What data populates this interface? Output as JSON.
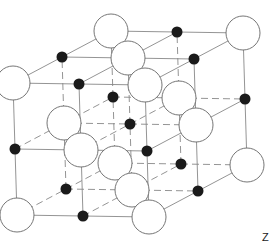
{
  "diagram": {
    "axis_label": "Z",
    "lattice": {
      "cells_per_edge": 2,
      "origin": [
        17,
        215
      ],
      "vec_a": [
        66,
        1
      ],
      "vec_b": [
        49,
        -26
      ],
      "vec_c": [
        -2,
        -66
      ]
    },
    "large_ion": {
      "name": "anion",
      "radius": 17,
      "fill": "#ffffff",
      "stroke": "#666666"
    },
    "small_ion": {
      "name": "cation",
      "radius": 5.5,
      "fill": "#1a1a1a"
    },
    "solid_line_color": "#888888",
    "dashed_line_color": "#888888"
  }
}
